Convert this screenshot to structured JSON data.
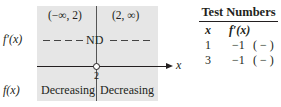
{
  "diagram": {
    "intervals": [
      "(−∞, 2)",
      "(2, ∞)"
    ],
    "fprime_label": "f′(x)",
    "f_label": "f(x)",
    "nd_label": "ND",
    "axis_label": "x",
    "critical_point": "2",
    "behavior": [
      "Decreasing",
      "Decreasing"
    ]
  },
  "table": {
    "title": "Test Numbers",
    "headers": [
      "x",
      "f′(x)"
    ],
    "rows": [
      {
        "x": "1",
        "fprime": "−1",
        "sign": "( − )"
      },
      {
        "x": "3",
        "fprime": "−1",
        "sign": "( − )"
      }
    ]
  }
}
